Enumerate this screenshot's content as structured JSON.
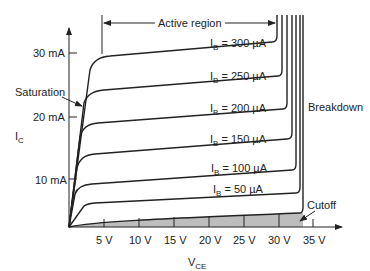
{
  "diagram": {
    "y_axis": {
      "label": "I",
      "label_sub": "C",
      "ticks": [
        "10 mA",
        "20 mA",
        "30 mA"
      ]
    },
    "x_axis": {
      "label": "V",
      "label_sub": "CE",
      "ticks": [
        "5 V",
        "10 V",
        "15 V",
        "20 V",
        "25 V",
        "30 V",
        "35 V"
      ]
    },
    "regions": {
      "active": "Active region",
      "saturation": "Saturation",
      "breakdown": "Breakdown",
      "cutoff": "Cutoff"
    },
    "curves": [
      {
        "label": "I",
        "sub": "B",
        "value": " = 300 µA"
      },
      {
        "label": "I",
        "sub": "B",
        "value": " = 250 µA"
      },
      {
        "label": "I",
        "sub": "B",
        "value": " = 200 µA"
      },
      {
        "label": "I",
        "sub": "B",
        "value": " = 150 µA"
      },
      {
        "label": "I",
        "sub": "B",
        "value": " = 100 µA"
      },
      {
        "label": "I",
        "sub": "B",
        "value": " = 50 µA"
      }
    ],
    "colors": {
      "line": "#222222",
      "cutoff_fill": "#bdbdbd"
    }
  }
}
